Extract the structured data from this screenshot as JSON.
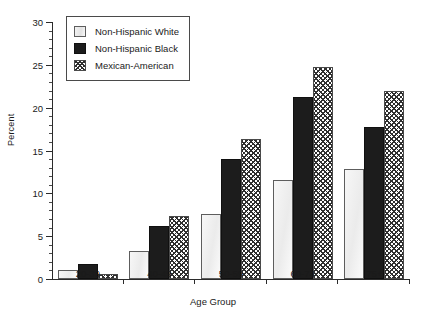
{
  "chart_data": {
    "type": "bar",
    "title": "",
    "xlabel": "Age Group",
    "ylabel": "Percent",
    "categories": [
      "20-39",
      "40-49",
      "50-59",
      "60-74",
      "75+"
    ],
    "series": [
      {
        "name": "Non-Hispanic White",
        "style": "white",
        "values": [
          1.1,
          3.3,
          7.6,
          11.5,
          12.9
        ]
      },
      {
        "name": "Non-Hispanic Black",
        "style": "black",
        "values": [
          1.7,
          6.2,
          14.0,
          21.2,
          17.8
        ]
      },
      {
        "name": "Mexican-American",
        "style": "hatch",
        "values": [
          0.6,
          7.4,
          16.3,
          24.8,
          22.0
        ]
      }
    ],
    "ylim": [
      0,
      30
    ],
    "y_major_ticks": [
      0,
      5,
      10,
      15,
      20,
      25,
      30
    ],
    "y_tick_labels": [
      "0",
      "5",
      "10",
      "15",
      "20",
      "25",
      "30"
    ],
    "y_minor_tick_step": 1,
    "grid": false,
    "legend_position": "top-left",
    "legend_entries": [
      "Non-Hispanic White",
      "Non-Hispanic Black",
      "Mexican-American"
    ]
  },
  "legend": {
    "items": [
      {
        "label": "Non-Hispanic White",
        "swatch": "white-square-icon"
      },
      {
        "label": "Non-Hispanic Black",
        "swatch": "black-square-icon"
      },
      {
        "label": "Mexican-American",
        "swatch": "crosshatch-square-icon"
      }
    ]
  }
}
